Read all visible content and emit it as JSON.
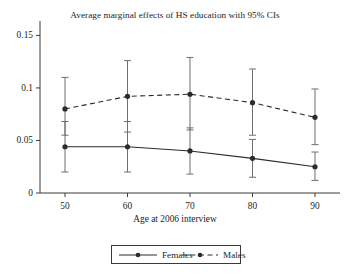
{
  "chart_data": {
    "type": "line",
    "title": "Average marginal effects of HS education with 95% CIs",
    "xlabel": "Age at 2006 interview",
    "ylabel": "",
    "x": [
      50,
      60,
      70,
      80,
      90
    ],
    "xticklabels": [
      "50",
      "60",
      "70",
      "80",
      "90"
    ],
    "yticks": [
      0,
      0.05,
      0.1,
      0.15
    ],
    "yticklabels": [
      "0",
      "0.05",
      "0.1",
      "0.15"
    ],
    "xlim": [
      46,
      94
    ],
    "ylim": [
      0,
      0.158
    ],
    "grid": false,
    "legend_position": "bottom-outside",
    "error_bars": "95% CI",
    "series": [
      {
        "name": "Females",
        "linestyle": "solid",
        "marker": "filled-circle",
        "color": "#2b2b2b",
        "values": [
          0.044,
          0.044,
          0.04,
          0.033,
          0.025
        ],
        "ci_lower": [
          0.02,
          0.02,
          0.018,
          0.015,
          0.012
        ],
        "ci_upper": [
          0.068,
          0.068,
          0.062,
          0.051,
          0.039
        ]
      },
      {
        "name": "Males",
        "linestyle": "dashed",
        "marker": "filled-circle",
        "color": "#2b2b2b",
        "values": [
          0.08,
          0.092,
          0.094,
          0.086,
          0.072
        ],
        "ci_lower": [
          0.055,
          0.058,
          0.06,
          0.055,
          0.046
        ],
        "ci_upper": [
          0.11,
          0.126,
          0.129,
          0.118,
          0.099
        ]
      }
    ]
  },
  "legend": {
    "items": [
      {
        "label": "Females"
      },
      {
        "label": "Males"
      }
    ]
  }
}
